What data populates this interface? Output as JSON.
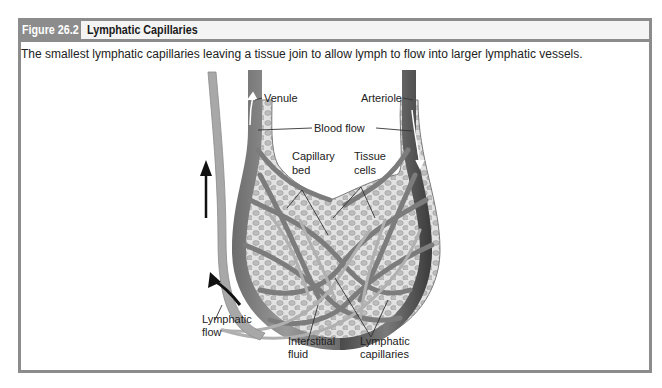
{
  "figure": {
    "number_label": "Figure 26.2",
    "title": "Lymphatic Capillaries",
    "caption": "The smallest lymphatic capillaries leaving a tissue join to allow lymph to flow into larger lymphatic vessels."
  },
  "diagram": {
    "labels": {
      "venule": "Venule",
      "arteriole": "Arteriole",
      "blood_flow": "Blood flow",
      "capillary_bed_line1": "Capillary",
      "capillary_bed_line2": "bed",
      "tissue_cells_line1": "Tissue",
      "tissue_cells_line2": "cells",
      "lymphatic_flow_line1": "Lymphatic",
      "lymphatic_flow_line2": "flow",
      "interstitial_fluid_line1": "Interstitial",
      "interstitial_fluid_line2": "fluid",
      "lymphatic_capillaries_line1": "Lymphatic",
      "lymphatic_capillaries_line2": "capillaries"
    },
    "colors": {
      "frame": "#8c8c8c",
      "vessel_dark": "#5a5a5a",
      "vessel_mid": "#8a8a8a",
      "tissue_fill": "#dcdcdc",
      "cell_fill": "#b8b8b8"
    }
  }
}
